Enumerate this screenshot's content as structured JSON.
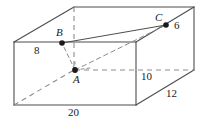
{
  "figure": {
    "type": "rectangular-prism-diagram",
    "stroke_color": "#4d4d4d",
    "dash_color": "#8c8c8c",
    "text_color": "#1a1a1a",
    "background": "#ffffff",
    "dimension_labels": {
      "height": "8",
      "width": "20",
      "depth_front": "10",
      "depth_diagonal": "12",
      "segment_right": "6"
    },
    "points": {
      "a": "A",
      "b": "B",
      "c": "C"
    }
  }
}
